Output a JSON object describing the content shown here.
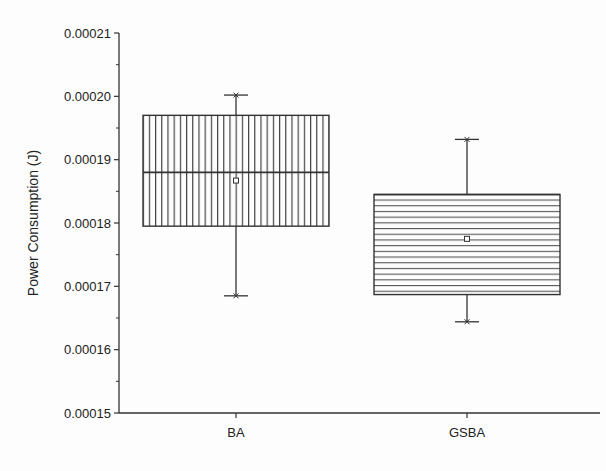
{
  "chart_data": {
    "type": "box",
    "title": "",
    "xlabel": "",
    "ylabel": "Power Consumption (J)",
    "ylim": [
      0.00015,
      0.00021
    ],
    "yticks": [
      "0.00015",
      "0.00016",
      "0.00017",
      "0.00018",
      "0.00019",
      "0.00020",
      "0.00021"
    ],
    "grid": false,
    "legend": null,
    "categories": [
      "BA",
      "GSBA"
    ],
    "series": [
      {
        "name": "BA",
        "pattern": "vertical-lines",
        "whisker_low": 0.0001685,
        "q1": 0.0001795,
        "median": 0.000188,
        "q3": 0.000197,
        "whisker_high": 0.0002002,
        "mean": 0.0001867
      },
      {
        "name": "GSBA",
        "pattern": "horizontal-lines",
        "whisker_low": 0.0001644,
        "q1": 0.0001687,
        "median": 0.0001845,
        "q3": 0.0001845,
        "whisker_high": 0.0001932,
        "mean": 0.0001775
      }
    ]
  },
  "colors": {
    "line": "#333333",
    "background": "#fdfdfd"
  }
}
